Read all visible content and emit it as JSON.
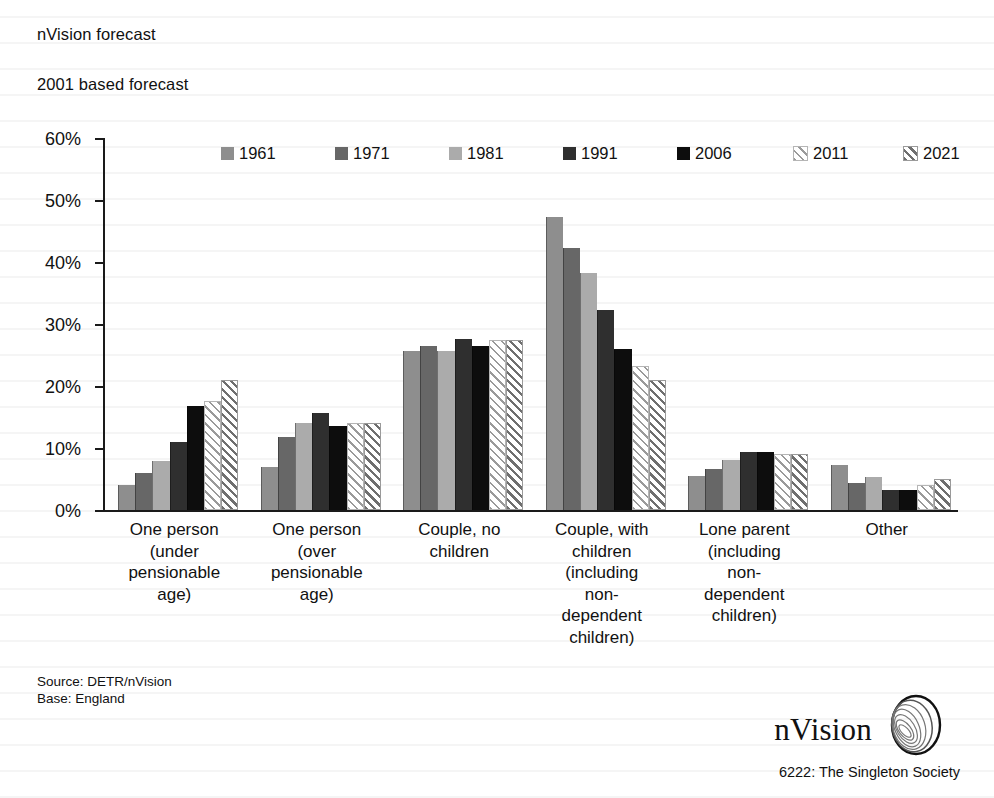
{
  "header": {
    "line1": "nVision forecast",
    "line2": "2001 based forecast"
  },
  "source": {
    "line1": "Source: DETR/nVision",
    "line2": "Base: England"
  },
  "brand": {
    "wordmark": "nVision",
    "caption": "6222: The Singleton Society"
  },
  "colors": {
    "1961": "#8e8e8e",
    "1971": "#676767",
    "1981": "#ababab",
    "1991": "#2f2f2f",
    "2006": "#0d0d0d",
    "2011": "#9a9a9a",
    "2021": "#6f6f6f",
    "axis": "#1a1a1a",
    "background": "#ffffff"
  },
  "chart_data": {
    "type": "bar",
    "title": "nVision forecast",
    "subtitle": "2001 based forecast",
    "xlabel": "",
    "ylabel": "",
    "ylim": [
      0,
      60
    ],
    "ytick_labels": [
      "0%",
      "10%",
      "20%",
      "30%",
      "40%",
      "50%",
      "60%"
    ],
    "ytick_values": [
      0,
      10,
      20,
      30,
      40,
      50,
      60
    ],
    "grid": false,
    "legend_position": "top",
    "categories": [
      "One person (under pensionable age)",
      "One person (over pensionable age)",
      "Couple, no children",
      "Couple, with children (including non-dependent children)",
      "Lone parent (including non-dependent children)",
      "Other"
    ],
    "category_lines": [
      [
        "One person",
        "(under",
        "pensionable",
        "age)"
      ],
      [
        "One person",
        "(over",
        "pensionable",
        "age)"
      ],
      [
        "Couple, no",
        "children"
      ],
      [
        "Couple, with",
        "children",
        "(including",
        "non-",
        "dependent",
        "children)"
      ],
      [
        "Lone parent",
        "(including",
        "non-",
        "dependent",
        "children)"
      ],
      [
        "Other"
      ]
    ],
    "series": [
      {
        "name": "1961",
        "values": [
          4.0,
          7.0,
          25.6,
          47.3,
          5.5,
          7.2
        ]
      },
      {
        "name": "1971",
        "values": [
          5.9,
          11.8,
          26.5,
          42.3,
          6.6,
          4.3
        ]
      },
      {
        "name": "1981",
        "values": [
          7.9,
          14.0,
          25.6,
          38.3,
          8.0,
          5.3
        ]
      },
      {
        "name": "1991",
        "values": [
          11.0,
          15.7,
          27.6,
          32.3,
          9.3,
          3.3
        ]
      },
      {
        "name": "2006",
        "values": [
          16.8,
          13.5,
          26.5,
          26.0,
          9.3,
          3.3
        ]
      },
      {
        "name": "2011",
        "values": [
          17.6,
          14.0,
          27.4,
          23.3,
          9.0,
          4.0
        ]
      },
      {
        "name": "2021",
        "values": [
          21.0,
          14.0,
          27.4,
          21.0,
          9.0,
          5.0
        ]
      }
    ]
  }
}
